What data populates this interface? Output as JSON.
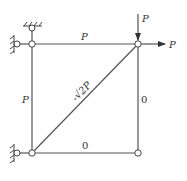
{
  "diagram": {
    "type": "truss",
    "colors": {
      "line": "#555555",
      "text": "#333333",
      "background": "#ffffff"
    },
    "members": {
      "top": {
        "label": "P"
      },
      "left": {
        "label": "P"
      },
      "diagonal": {
        "label": "-√2P"
      },
      "right": {
        "label": "0"
      },
      "bottom": {
        "label": "0"
      }
    },
    "loads": {
      "vertical": {
        "label": "P",
        "direction": "down"
      },
      "horizontal": {
        "label": "P",
        "direction": "right"
      }
    },
    "supports": [
      "top-fixed-pin",
      "left-fixed-pin-upper",
      "left-fixed-pin-lower"
    ]
  }
}
